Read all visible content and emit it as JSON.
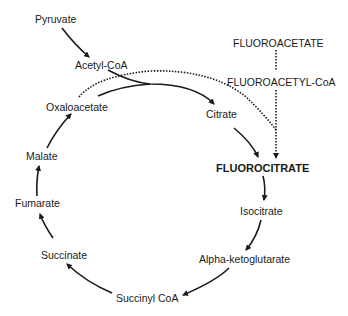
{
  "diagram": {
    "title": "",
    "nodes": {
      "pyruvate": "Pyruvate",
      "acetyl_coa": "Acetyl-CoA",
      "oxaloacetate": "Oxaloacetate",
      "citrate": "Citrate",
      "fluorocitrate": "FLUOROCITRATE",
      "isocitrate": "Isocitrate",
      "alpha_ketoglutarate": "Alpha-ketoglutarate",
      "succinyl_coa": "Succinyl CoA",
      "succinate": "Succinate",
      "fumarate": "Fumarate",
      "malate": "Malate",
      "fluoroacetate": "FLUOROACETATE",
      "fluoroacetyl_coa": "FLUOROACETYL-CoA"
    },
    "edges": [
      {
        "from": "Pyruvate",
        "to": "Acetyl-CoA",
        "style": "solid"
      },
      {
        "from": "Acetyl-CoA",
        "to": "Citrate",
        "style": "solid"
      },
      {
        "from": "Oxaloacetate",
        "to": "Citrate",
        "style": "solid"
      },
      {
        "from": "Citrate",
        "to": "FLUOROCITRATE",
        "style": "solid"
      },
      {
        "from": "FLUOROCITRATE",
        "to": "Isocitrate",
        "style": "solid"
      },
      {
        "from": "Isocitrate",
        "to": "Alpha-ketoglutarate",
        "style": "solid"
      },
      {
        "from": "Alpha-ketoglutarate",
        "to": "Succinyl CoA",
        "style": "solid"
      },
      {
        "from": "Succinyl CoA",
        "to": "Succinate",
        "style": "solid"
      },
      {
        "from": "Succinate",
        "to": "Fumarate",
        "style": "solid"
      },
      {
        "from": "Fumarate",
        "to": "Malate",
        "style": "solid"
      },
      {
        "from": "Malate",
        "to": "Oxaloacetate",
        "style": "solid"
      },
      {
        "from": "FLUOROACETATE",
        "to": "FLUOROACETYL-CoA",
        "style": "dotted"
      },
      {
        "from": "FLUOROACETYL-CoA",
        "to": "FLUOROCITRATE",
        "style": "dotted"
      },
      {
        "from": "Oxaloacetate",
        "to": "FLUOROCITRATE",
        "style": "dotted"
      }
    ],
    "colors": {
      "line": "#1a1a1a",
      "background": "#ffffff"
    }
  }
}
